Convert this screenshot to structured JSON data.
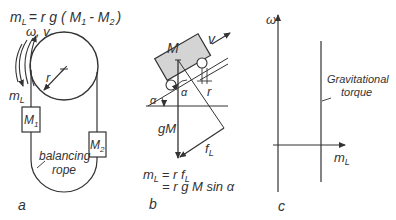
{
  "panel_a": {
    "label": "a",
    "equation": "m_L = r g ( M_1 - M_2 )",
    "eq_parts": {
      "lhs": "m",
      "lhs_sub": "L",
      "mid": "= r g ( M",
      "m1sub": "1",
      "minus": "- M",
      "m2sub": "2",
      "close": ")"
    },
    "omega_v": "ω, v",
    "radius": "r",
    "torque": "m",
    "torque_sub": "L",
    "mass1": "M",
    "mass1_sub": "1",
    "mass2": "M",
    "mass2_sub": "2",
    "rope_line1": "balancing",
    "rope_line2": "rope"
  },
  "panel_b": {
    "label": "b",
    "mass": "M",
    "velocity": "v",
    "radius": "r",
    "angle": "α",
    "weight": "gM",
    "force": "f",
    "force_sub": "L",
    "eq_line1": {
      "lhs": "m",
      "lhs_sub": "L",
      "rhs": "= r f",
      "rhs_sub": "L"
    },
    "eq_line2": "= r g M  sin α"
  },
  "panel_c": {
    "label": "c",
    "y_axis": "ω",
    "x_axis": "m",
    "x_axis_sub": "L",
    "curve_line1": "Gravitational",
    "curve_line2": "torque"
  },
  "colors": {
    "stroke": "#333333",
    "box_fill": "#d4d4d4",
    "background": "#ffffff"
  }
}
